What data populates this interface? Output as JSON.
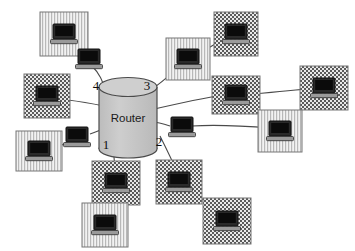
{
  "diagram": {
    "background_color": "#ffffff",
    "line_color": "#4a4a4a",
    "router": {
      "label": "Router",
      "shape": "cylinder",
      "fill_color": "#c9c9c9",
      "stroke_color": "#4a4a4a",
      "center_x": 128,
      "center_y": 118,
      "width": 58,
      "height": 62
    },
    "port_labels": [
      {
        "name": "port-1",
        "text": "1",
        "x": 106,
        "y": 146
      },
      {
        "name": "port-2",
        "text": "2",
        "x": 159,
        "y": 143
      },
      {
        "name": "port-3",
        "text": "3",
        "x": 147,
        "y": 87
      },
      {
        "name": "port-4",
        "text": "4",
        "x": 96,
        "y": 87
      }
    ],
    "nodes": [
      {
        "id": "n1",
        "name": "workstation-top-left",
        "x": 40,
        "y": 12,
        "w": 48,
        "h": 44,
        "pattern": "vertical-stripes",
        "boxed": true
      },
      {
        "id": "n2",
        "name": "workstation-upper-left-bare",
        "x": 76,
        "y": 48,
        "w": 26,
        "h": 22,
        "pattern": "none",
        "boxed": false
      },
      {
        "id": "n3",
        "name": "workstation-mid-left",
        "x": 24,
        "y": 74,
        "w": 46,
        "h": 44,
        "pattern": "dots",
        "boxed": true
      },
      {
        "id": "n4",
        "name": "workstation-left-bare",
        "x": 64,
        "y": 126,
        "w": 26,
        "h": 22,
        "pattern": "none",
        "boxed": false
      },
      {
        "id": "n5",
        "name": "workstation-lower-left",
        "x": 16,
        "y": 131,
        "w": 46,
        "h": 40,
        "pattern": "vertical-stripes",
        "boxed": true
      },
      {
        "id": "n6",
        "name": "workstation-bottom-center",
        "x": 92,
        "y": 161,
        "w": 48,
        "h": 44,
        "pattern": "dots",
        "boxed": true
      },
      {
        "id": "n7",
        "name": "workstation-bottom-left-lower",
        "x": 82,
        "y": 203,
        "w": 46,
        "h": 44,
        "pattern": "vertical-stripes",
        "boxed": true
      },
      {
        "id": "n8",
        "name": "workstation-top-center",
        "x": 166,
        "y": 38,
        "w": 44,
        "h": 42,
        "pattern": "vertical-stripes",
        "boxed": true
      },
      {
        "id": "n9",
        "name": "workstation-top-right",
        "x": 214,
        "y": 12,
        "w": 44,
        "h": 44,
        "pattern": "dots",
        "boxed": true
      },
      {
        "id": "n10",
        "name": "workstation-center-bare",
        "x": 169,
        "y": 116,
        "w": 26,
        "h": 22,
        "pattern": "none",
        "boxed": false
      },
      {
        "id": "n11",
        "name": "workstation-mid-right",
        "x": 212,
        "y": 76,
        "w": 48,
        "h": 38,
        "pattern": "dots",
        "boxed": true
      },
      {
        "id": "n12",
        "name": "workstation-far-right",
        "x": 300,
        "y": 66,
        "w": 48,
        "h": 44,
        "pattern": "dots",
        "boxed": true
      },
      {
        "id": "n13",
        "name": "workstation-right-lower",
        "x": 258,
        "y": 110,
        "w": 44,
        "h": 42,
        "pattern": "vertical-stripes",
        "boxed": true
      },
      {
        "id": "n14",
        "name": "workstation-bottom-mid-right",
        "x": 156,
        "y": 160,
        "w": 46,
        "h": 44,
        "pattern": "dots",
        "boxed": true
      },
      {
        "id": "n15",
        "name": "workstation-bottom-right",
        "x": 203,
        "y": 198,
        "w": 48,
        "h": 46,
        "pattern": "dots",
        "boxed": true
      }
    ],
    "links": [
      {
        "name": "link-n1-n2",
        "path": "M 76,44 C 84,50 86,54 90,60"
      },
      {
        "name": "link-n2-port4",
        "path": "M 92,66 C 100,74 102,80 106,92"
      },
      {
        "name": "link-n3-router",
        "path": "M 68,100 C 84,102 94,104 104,106"
      },
      {
        "name": "link-n4-router",
        "path": "M 90,134 C 96,132 100,130 106,128"
      },
      {
        "name": "link-n5-n4",
        "path": "M 54,150 C 62,145 68,141 74,138"
      },
      {
        "name": "link-port1-n6",
        "path": "M 112,136 C 114,150 114,164 116,178"
      },
      {
        "name": "link-n6-n7",
        "path": "M 114,192 C 112,200 110,208 108,216"
      },
      {
        "name": "link-port3-n8",
        "path": "M 144,94 C 156,88 166,78 178,68"
      },
      {
        "name": "link-n8-n9",
        "path": "M 192,58 C 208,48 218,42 230,36"
      },
      {
        "name": "link-router-n10",
        "path": "M 152,122 C 158,122 164,124 170,126"
      },
      {
        "name": "link-n10-n13",
        "path": "M 192,126 C 220,124 246,126 272,128"
      },
      {
        "name": "link-n11-n12",
        "path": "M 252,94 C 276,92 298,90 316,88"
      },
      {
        "name": "link-router-n11",
        "path": "M 150,110 C 176,104 204,98 228,94"
      },
      {
        "name": "link-port2-n14",
        "path": "M 160,136 C 166,148 172,160 178,174"
      },
      {
        "name": "link-n14-n15",
        "path": "M 186,186 C 198,196 208,204 220,212"
      }
    ]
  }
}
